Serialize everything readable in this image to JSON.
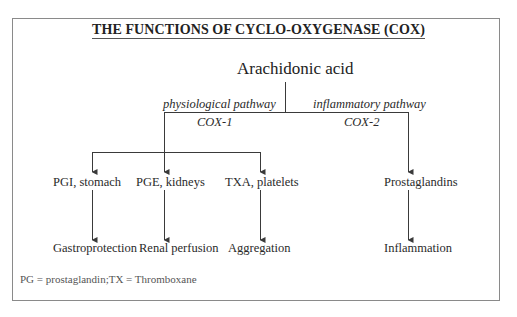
{
  "title": "THE FUNCTIONS OF CYCLO-OXYGENASE (COX)",
  "root": "Arachidonic acid",
  "pathways": [
    {
      "label": "physiological pathway",
      "enzyme": "COX-1"
    },
    {
      "label": "inflammatory pathway",
      "enzyme": "COX-2"
    }
  ],
  "mediators": [
    {
      "label": "PGI, stomach",
      "outcome": "Gastroprotection"
    },
    {
      "label": "PGE, kidneys",
      "outcome": "Renal perfusion"
    },
    {
      "label": "TXA, platelets",
      "outcome": "Aggregation"
    },
    {
      "label": "Prostaglandins",
      "outcome": "Inflammation"
    }
  ],
  "footnote": "PG = prostaglandin;TX = Thromboxane",
  "colors": {
    "line": "#3a3a3a",
    "frame": "#8a8a8a",
    "text": "#2a2a2a"
  }
}
